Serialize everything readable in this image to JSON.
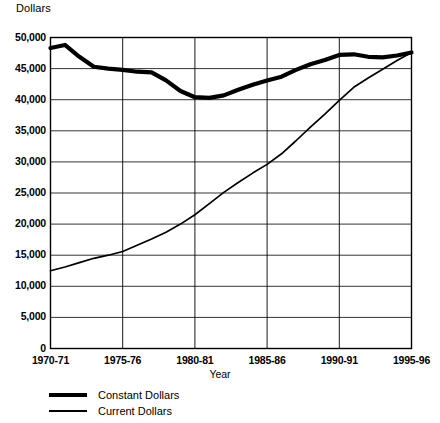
{
  "chart_data": {
    "type": "line",
    "title": "",
    "xlabel": "Year",
    "ylabel": "Dollars",
    "ylim": [
      0,
      50000
    ],
    "xlim": [
      1970,
      1995
    ],
    "grid": true,
    "legend_position": "below-left",
    "y_ticks": [
      "0",
      "5,000",
      "10,000",
      "15,000",
      "20,000",
      "25,000",
      "30,000",
      "35,000",
      "40,000",
      "45,000",
      "50,000"
    ],
    "y_tick_values": [
      0,
      5000,
      10000,
      15000,
      20000,
      25000,
      30000,
      35000,
      40000,
      45000,
      50000
    ],
    "x_ticks": [
      "1970-71",
      "1975-76",
      "1980-81",
      "1985-86",
      "1990-91",
      "1995-96"
    ],
    "x_tick_values": [
      1970,
      1975,
      1980,
      1985,
      1990,
      1995
    ],
    "x": [
      1970,
      1971,
      1972,
      1973,
      1974,
      1975,
      1976,
      1977,
      1978,
      1979,
      1980,
      1981,
      1982,
      1983,
      1984,
      1985,
      1986,
      1987,
      1988,
      1989,
      1990,
      1991,
      1992,
      1993,
      1994,
      1995
    ],
    "series": [
      {
        "name": "Constant Dollars",
        "style": "thick",
        "values": [
          48300,
          48800,
          46900,
          45300,
          45000,
          44800,
          44500,
          44400,
          43100,
          41400,
          40400,
          40300,
          40700,
          41600,
          42400,
          43100,
          43700,
          44800,
          45700,
          46400,
          47200,
          47300,
          46900,
          46800,
          47100,
          47600
        ]
      },
      {
        "name": "Current Dollars",
        "style": "thin",
        "values": [
          12500,
          13100,
          13800,
          14500,
          15000,
          15600,
          16600,
          17600,
          18700,
          20000,
          21500,
          23300,
          25100,
          26700,
          28200,
          29600,
          31300,
          33400,
          35600,
          37700,
          39900,
          42000,
          43500,
          44900,
          46300,
          47600
        ]
      }
    ]
  },
  "legend": {
    "items": [
      {
        "label": "Constant Dollars",
        "style": "thick"
      },
      {
        "label": "Current Dollars",
        "style": "thin"
      }
    ]
  }
}
